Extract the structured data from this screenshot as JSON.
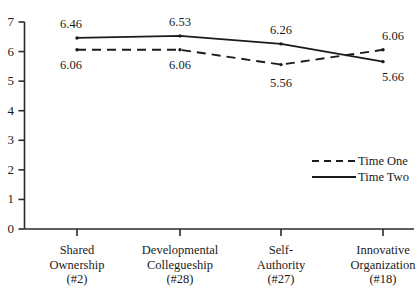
{
  "chart_data": {
    "type": "line",
    "title": "",
    "subtitle": "",
    "xlabel": "",
    "ylabel": "",
    "ylim": [
      0,
      7
    ],
    "yticks": [
      "0",
      "1",
      "2",
      "3",
      "4",
      "5",
      "6",
      "7"
    ],
    "grid": false,
    "legend_position": "right-middle",
    "categories": [
      "Shared\nOwnership\n(#2)",
      "Developmental\nCollegueship\n(#28)",
      "Self-\nAuthority\n(#27)",
      "Innovative\nOrganization\n(#18)"
    ],
    "category_lines": [
      [
        "Shared",
        "Ownership",
        "(#2)"
      ],
      [
        "Developmental",
        "Collegueship",
        "(#28)"
      ],
      [
        "Self-",
        "Authority",
        "(#27)"
      ],
      [
        "Innovative",
        "Organization",
        "(#18)"
      ]
    ],
    "series": [
      {
        "name": "Time One",
        "style": "dashed",
        "color": "#1b1b1b",
        "values": [
          6.06,
          6.06,
          5.56,
          6.06
        ],
        "labels": [
          "6.06",
          "6.06",
          "5.56",
          "6.06"
        ],
        "label_side": [
          "below",
          "below",
          "below",
          "above"
        ]
      },
      {
        "name": "Time Two",
        "style": "solid",
        "color": "#1b1b1b",
        "values": [
          6.46,
          6.53,
          6.26,
          5.66
        ],
        "labels": [
          "6.46",
          "6.53",
          "6.26",
          "5.66"
        ],
        "label_side": [
          "above",
          "above",
          "above",
          "below"
        ]
      }
    ]
  },
  "legend": {
    "items": [
      {
        "label": "Time One",
        "style": "dashed"
      },
      {
        "label": "Time Two",
        "style": "solid"
      }
    ]
  },
  "axis": {
    "y_tick_0": "0",
    "y_tick_1": "1",
    "y_tick_2": "2",
    "y_tick_3": "3",
    "y_tick_4": "4",
    "y_tick_5": "5",
    "y_tick_6": "6",
    "y_tick_7": "7"
  },
  "colors": {
    "line": "#1b1b1b",
    "axis": "#2a2a2a",
    "text": "#1b1b1b",
    "background": "#ffffff"
  }
}
